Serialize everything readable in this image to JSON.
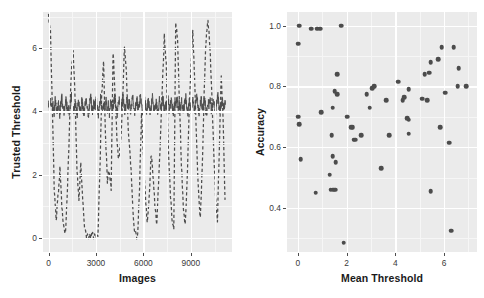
{
  "figure": {
    "width": 484,
    "height": 298,
    "background": "#ffffff",
    "panel_background": "#ebebeb",
    "grid_color": "#ffffff",
    "ink_color": "#4c4c4c"
  },
  "chart_data": [
    {
      "id": "left-panel",
      "type": "line",
      "title": "",
      "xlabel": "Images",
      "ylabel": "Trusted Threshold",
      "xlim": [
        -350,
        11600
      ],
      "ylim": [
        -0.45,
        7.15
      ],
      "xticks": [
        0,
        3000,
        6000,
        9000
      ],
      "xticklabels": [
        "0",
        "3000",
        "6000",
        "9000"
      ],
      "yticks": [
        0,
        2,
        4,
        6
      ],
      "yticklabels": [
        "0",
        "2",
        "4",
        "6"
      ],
      "grid": true,
      "legend": "none",
      "series": [
        {
          "name": "trusted-threshold-solid",
          "style": "solid",
          "color": "#4c4c4c",
          "description": "Noisy stationary signal oscillating about 4.2",
          "x": [
            0,
            70,
            140,
            210,
            280,
            350,
            420,
            490,
            560,
            630,
            700,
            770,
            840,
            910,
            980,
            1050,
            1120,
            1190,
            1260,
            1330,
            1400,
            1470,
            1540,
            1610,
            1680,
            1750,
            1820,
            1890,
            1960,
            2030,
            2100,
            2170,
            2240,
            2310,
            2380,
            2450,
            2520,
            2590,
            2660,
            2730,
            2800,
            2870,
            2940,
            3010,
            3080,
            3150,
            3220,
            3290,
            3360,
            3430,
            3500,
            3570,
            3640,
            3710,
            3780,
            3850,
            3920,
            3990,
            4060,
            4130,
            4200,
            4270,
            4340,
            4410,
            4480,
            4550,
            4620,
            4690,
            4760,
            4830,
            4900,
            4970,
            5040,
            5110,
            5180,
            5250,
            5320,
            5390,
            5460,
            5530,
            5600,
            5670,
            5740,
            5810,
            5880,
            5950,
            6020,
            6090,
            6160,
            6230,
            6300,
            6370,
            6440,
            6510,
            6580,
            6650,
            6720,
            6790,
            6860,
            6930,
            7000,
            7070,
            7140,
            7210,
            7280,
            7350,
            7420,
            7490,
            7560,
            7630,
            7700,
            7770,
            7840,
            7910,
            7980,
            8050,
            8120,
            8190,
            8260,
            8330,
            8400,
            8470,
            8540,
            8610,
            8680,
            8750,
            8820,
            8890,
            8960,
            9030,
            9100,
            9170,
            9240,
            9310,
            9380,
            9450,
            9520,
            9590,
            9660,
            9730,
            9800,
            9870,
            9940,
            10010,
            10080,
            10150,
            10220,
            10290,
            10360,
            10430,
            10500,
            10570,
            10640,
            10710,
            10780,
            10850,
            10920,
            10990,
            11060,
            11130,
            11200
          ],
          "y": [
            4.2,
            4.12,
            4.31,
            4.08,
            4.25,
            3.92,
            4.35,
            4.1,
            4.02,
            4.28,
            3.88,
            4.18,
            4.45,
            4.05,
            3.95,
            4.22,
            4.38,
            4.0,
            4.15,
            3.85,
            4.3,
            4.52,
            4.08,
            3.98,
            4.26,
            4.11,
            3.9,
            4.33,
            4.17,
            4.02,
            4.41,
            4.09,
            3.96,
            4.24,
            4.35,
            4.06,
            3.88,
            4.19,
            4.47,
            4.13,
            3.99,
            4.29,
            4.04,
            4.36,
            4.15,
            3.93,
            4.22,
            4.44,
            4.07,
            3.97,
            4.27,
            4.12,
            4.39,
            4.01,
            4.2,
            3.91,
            4.33,
            4.16,
            4.05,
            4.3,
            4.49,
            4.1,
            3.94,
            4.23,
            4.37,
            4.03,
            4.18,
            4.55,
            4.26,
            3.99,
            4.14,
            4.42,
            4.08,
            4.31,
            4.0,
            4.21,
            4.46,
            4.11,
            3.96,
            4.28,
            4.34,
            4.06,
            4.19,
            4.51,
            4.13,
            3.98,
            4.24,
            4.4,
            4.09,
            4.02,
            4.32,
            4.17,
            3.93,
            4.25,
            4.48,
            4.1,
            4.04,
            4.29,
            4.15,
            3.9,
            4.36,
            4.21,
            4.07,
            4.53,
            4.18,
            3.97,
            4.27,
            4.12,
            4.43,
            4.01,
            4.22,
            4.34,
            4.08,
            3.95,
            4.3,
            4.16,
            4.5,
            4.05,
            4.24,
            3.99,
            4.38,
            4.14,
            4.03,
            4.26,
            4.45,
            4.1,
            3.92,
            4.31,
            4.19,
            4.07,
            4.4,
            4.23,
            4.01,
            4.28,
            4.54,
            4.12,
            3.96,
            4.25,
            4.36,
            4.09,
            4.17,
            4.47,
            4.04,
            3.98,
            4.29,
            4.21,
            4.42,
            4.06,
            4.15,
            4.33,
            4.11,
            3.94,
            4.27,
            4.49,
            4.13,
            4.02,
            4.24,
            4.35,
            4.08,
            4.19,
            4.3,
            4.16,
            4.05,
            4.22
          ]
        },
        {
          "name": "untrusted-threshold-dashed",
          "style": "dashed",
          "color": "#4c4c4c",
          "description": "High-amplitude oscillation sweeping between 0 and 7",
          "x": [
            0,
            120,
            240,
            360,
            480,
            600,
            720,
            840,
            960,
            1080,
            1200,
            1320,
            1440,
            1560,
            1680,
            1800,
            1920,
            2040,
            2160,
            2280,
            2400,
            2520,
            2640,
            2760,
            2880,
            3000,
            3120,
            3240,
            3360,
            3480,
            3600,
            3720,
            3840,
            3960,
            4080,
            4200,
            4320,
            4440,
            4560,
            4680,
            4800,
            4920,
            5040,
            5160,
            5280,
            5400,
            5520,
            5640,
            5760,
            5880,
            6000,
            6120,
            6240,
            6360,
            6480,
            6600,
            6720,
            6840,
            6960,
            7080,
            7200,
            7320,
            7440,
            7560,
            7680,
            7800,
            7920,
            8040,
            8160,
            8280,
            8400,
            8520,
            8640,
            8760,
            8880,
            9000,
            9120,
            9240,
            9360,
            9480,
            9600,
            9720,
            9840,
            9960,
            10080,
            10200,
            10320,
            10440,
            10560,
            10680,
            10800,
            10920,
            11040,
            11160
          ],
          "y": [
            7.05,
            6.6,
            4.1,
            1.55,
            0.55,
            1.3,
            2.2,
            1.05,
            0.35,
            0.2,
            1.6,
            3.4,
            5.25,
            5.85,
            4.4,
            2.1,
            1.25,
            2.35,
            1.15,
            0.25,
            0.08,
            0.05,
            0.06,
            0.1,
            0.05,
            0.07,
            0.06,
            1.95,
            4.5,
            5.6,
            3.3,
            1.8,
            2.15,
            1.6,
            5.9,
            4.7,
            3.15,
            2.45,
            3.05,
            4.35,
            6.1,
            5.3,
            3.4,
            2.7,
            1.5,
            0.3,
            0.06,
            0.08,
            1.7,
            3.9,
            2.55,
            1.35,
            0.45,
            1.2,
            2.65,
            2.05,
            1.1,
            0.35,
            1.85,
            3.2,
            4.85,
            6.4,
            5.55,
            3.05,
            1.65,
            0.55,
            0.25,
            6.85,
            6.2,
            4.3,
            2.35,
            1.05,
            0.4,
            1.75,
            3.85,
            5.4,
            6.55,
            4.95,
            3.1,
            1.45,
            0.6,
            2.25,
            4.6,
            6.3,
            6.95,
            6.1,
            4.55,
            2.8,
            1.35,
            0.5,
            2.9,
            5.15,
            3.75,
            1.2
          ]
        }
      ]
    },
    {
      "id": "right-panel",
      "type": "scatter",
      "title": "",
      "xlabel": "Mean Threshold",
      "ylabel": "Accuracy",
      "xlim": [
        -0.45,
        7.35
      ],
      "ylim": [
        0.255,
        1.045
      ],
      "xticks": [
        0,
        2,
        4,
        6
      ],
      "xticklabels": [
        "0",
        "2",
        "4",
        "6"
      ],
      "yticks": [
        0.4,
        0.6,
        0.8,
        1.0
      ],
      "yticklabels": [
        "0.4",
        "0.6",
        "0.8",
        "1.0"
      ],
      "grid": true,
      "legend": "none",
      "marker_color": "#4c4c4c",
      "points": [
        [
          0.05,
          1.0
        ],
        [
          0.55,
          0.99
        ],
        [
          0.8,
          0.99
        ],
        [
          0.92,
          0.99
        ],
        [
          1.78,
          1.0
        ],
        [
          0.02,
          0.94
        ],
        [
          5.9,
          0.93
        ],
        [
          6.4,
          0.93
        ],
        [
          5.45,
          0.88
        ],
        [
          5.75,
          0.89
        ],
        [
          6.6,
          0.86
        ],
        [
          1.62,
          0.84
        ],
        [
          5.2,
          0.84
        ],
        [
          5.38,
          0.845
        ],
        [
          3.05,
          0.795
        ],
        [
          3.12,
          0.8
        ],
        [
          4.12,
          0.815
        ],
        [
          4.55,
          0.79
        ],
        [
          6.05,
          0.78
        ],
        [
          6.55,
          0.8
        ],
        [
          6.9,
          0.8
        ],
        [
          1.5,
          0.785
        ],
        [
          1.6,
          0.775
        ],
        [
          2.82,
          0.775
        ],
        [
          3.62,
          0.755
        ],
        [
          4.35,
          0.765
        ],
        [
          5.1,
          0.76
        ],
        [
          5.3,
          0.755
        ],
        [
          1.42,
          0.73
        ],
        [
          2.95,
          0.73
        ],
        [
          4.3,
          0.755
        ],
        [
          0.95,
          0.715
        ],
        [
          2.02,
          0.7
        ],
        [
          4.48,
          0.695
        ],
        [
          4.55,
          0.69
        ],
        [
          0.02,
          0.7
        ],
        [
          0.04,
          0.675
        ],
        [
          2.25,
          0.665
        ],
        [
          2.18,
          0.665
        ],
        [
          5.85,
          0.665
        ],
        [
          1.38,
          0.64
        ],
        [
          2.6,
          0.64
        ],
        [
          3.75,
          0.64
        ],
        [
          4.55,
          0.645
        ],
        [
          2.28,
          0.625
        ],
        [
          2.35,
          0.625
        ],
        [
          6.22,
          0.615
        ],
        [
          0.12,
          0.56
        ],
        [
          1.42,
          0.57
        ],
        [
          1.55,
          0.55
        ],
        [
          1.3,
          0.51
        ],
        [
          3.42,
          0.53
        ],
        [
          0.72,
          0.45
        ],
        [
          1.35,
          0.46
        ],
        [
          1.45,
          0.46
        ],
        [
          1.52,
          0.46
        ],
        [
          5.45,
          0.455
        ],
        [
          6.3,
          0.325
        ],
        [
          1.88,
          0.285
        ]
      ]
    }
  ],
  "left_panel": {
    "ylabel": "Trusted Threshold",
    "xlabel": "Images",
    "yticklabels": [
      "0",
      "2",
      "4",
      "6"
    ],
    "xticklabels": [
      "0",
      "3000",
      "6000",
      "9000"
    ]
  },
  "right_panel": {
    "ylabel": "Accuracy",
    "xlabel": "Mean Threshold",
    "yticklabels": [
      "0.4",
      "0.6",
      "0.8",
      "1.0"
    ],
    "xticklabels": [
      "0",
      "2",
      "4",
      "6"
    ]
  }
}
